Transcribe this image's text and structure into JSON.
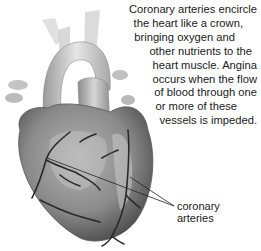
{
  "caption": {
    "lines": [
      "Coronary arteries encircle",
      "the heart like a crown,",
      "bringing oxygen and",
      "other nutrients to the",
      "heart muscle. Angina",
      "occurs when the flow",
      "of blood through one",
      "or more of these",
      "vessels is impeded."
    ]
  },
  "label": {
    "lines": [
      "coronary",
      "arteries"
    ]
  },
  "illustration": {
    "subject": "heart-with-coronary-arteries",
    "style": "grayscale"
  }
}
